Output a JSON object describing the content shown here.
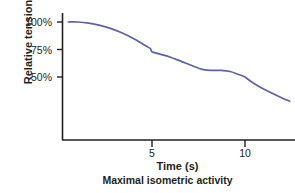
{
  "chart_data": {
    "type": "line",
    "title": "",
    "xlabel": "Time (s)",
    "xlabel_secondary": "Maximal isometric activity",
    "ylabel": "Relative tension",
    "grid": false,
    "legend": "none",
    "xlim": [
      0,
      12.6
    ],
    "ylim": [
      22,
      106
    ],
    "xticks": [
      5,
      10
    ],
    "xtick_labels": [
      "5",
      "10"
    ],
    "yticks": [
      50,
      75,
      100
    ],
    "ytick_labels": [
      "50%",
      "75%",
      "100%"
    ],
    "series": [
      {
        "name": "Relative tension",
        "color": "#5f62a8",
        "x": [
          0.5,
          1.0,
          1.6,
          2.2,
          2.8,
          3.4,
          4.0,
          4.5,
          4.9,
          5.0,
          5.4,
          6.0,
          6.6,
          7.2,
          7.7,
          8.2,
          8.7,
          9.2,
          9.7,
          10.0,
          10.4,
          11.0,
          11.6,
          12.1,
          12.4
        ],
        "y": [
          100,
          100,
          99,
          97,
          94,
          90,
          85,
          80,
          76,
          73,
          71,
          68,
          64,
          60,
          57,
          56,
          56,
          55,
          52,
          50,
          45,
          39,
          34,
          30,
          28
        ]
      }
    ],
    "axis_color": "#231f20",
    "background_color": "#ffffff"
  },
  "axes": {
    "y_tick_0": "50%",
    "y_tick_1": "75%",
    "y_tick_2": "100%",
    "x_tick_0": "5",
    "x_tick_1": "10"
  }
}
